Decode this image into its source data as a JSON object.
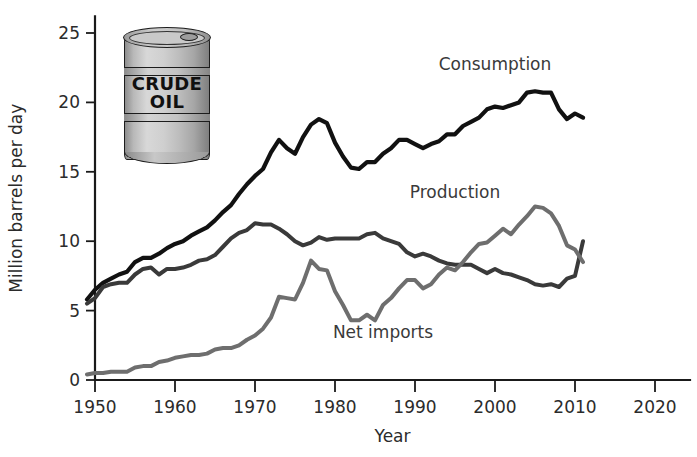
{
  "chart_data": {
    "type": "line",
    "title": "",
    "xlabel": "Year",
    "ylabel": "Million barrels per day",
    "xlim": [
      1948,
      2022
    ],
    "ylim": [
      0,
      26
    ],
    "xticks": [
      1950,
      1960,
      1970,
      1980,
      1990,
      2000,
      2010,
      2020
    ],
    "xtick_labels": [
      "1950",
      "1960",
      "1970",
      "1980",
      "1990",
      "2000",
      "2010",
      "2020"
    ],
    "yticks": [
      0,
      5,
      10,
      15,
      20,
      25
    ],
    "ytick_labels": [
      "0",
      "5",
      "10",
      "15",
      "20",
      "25"
    ],
    "grid": false,
    "legend_position": "inline-annotations",
    "x": [
      1949,
      1950,
      1951,
      1952,
      1953,
      1954,
      1955,
      1956,
      1957,
      1958,
      1959,
      1960,
      1961,
      1962,
      1963,
      1964,
      1965,
      1966,
      1967,
      1968,
      1969,
      1970,
      1971,
      1972,
      1973,
      1974,
      1975,
      1976,
      1977,
      1978,
      1979,
      1980,
      1981,
      1982,
      1983,
      1984,
      1985,
      1986,
      1987,
      1988,
      1989,
      1990,
      1991,
      1992,
      1993,
      1994,
      1995,
      1996,
      1997,
      1998,
      1999,
      2000,
      2001,
      2002,
      2003,
      2004,
      2005,
      2006,
      2007,
      2008,
      2009,
      2010,
      2011
    ],
    "series": [
      {
        "name": "Consumption",
        "color": "#111111",
        "width": 4.2,
        "label_x": 2000,
        "label_y": 22.3,
        "values": [
          5.8,
          6.5,
          7.0,
          7.3,
          7.6,
          7.8,
          8.5,
          8.8,
          8.8,
          9.1,
          9.5,
          9.8,
          10.0,
          10.4,
          10.7,
          11.0,
          11.5,
          12.1,
          12.6,
          13.4,
          14.1,
          14.7,
          15.2,
          16.4,
          17.3,
          16.7,
          16.3,
          17.5,
          18.4,
          18.8,
          18.5,
          17.1,
          16.1,
          15.3,
          15.2,
          15.7,
          15.7,
          16.3,
          16.7,
          17.3,
          17.3,
          17.0,
          16.7,
          17.0,
          17.2,
          17.7,
          17.7,
          18.3,
          18.6,
          18.9,
          19.5,
          19.7,
          19.6,
          19.8,
          20.0,
          20.7,
          20.8,
          20.7,
          20.7,
          19.5,
          18.8,
          19.2,
          18.9
        ]
      },
      {
        "name": "Production",
        "color": "#3a3a3a",
        "width": 4.0,
        "label_x": 1995,
        "label_y": 13.1,
        "values": [
          5.5,
          5.9,
          6.7,
          6.9,
          7.0,
          7.0,
          7.6,
          8.0,
          8.1,
          7.6,
          8.0,
          8.0,
          8.1,
          8.3,
          8.6,
          8.7,
          9.0,
          9.6,
          10.2,
          10.6,
          10.8,
          11.3,
          11.2,
          11.2,
          10.9,
          10.5,
          10.0,
          9.7,
          9.9,
          10.3,
          10.1,
          10.2,
          10.2,
          10.2,
          10.2,
          10.5,
          10.6,
          10.2,
          10.0,
          9.8,
          9.2,
          8.9,
          9.1,
          8.9,
          8.6,
          8.4,
          8.3,
          8.3,
          8.3,
          8.0,
          7.7,
          8.0,
          7.7,
          7.6,
          7.4,
          7.2,
          6.9,
          6.8,
          6.9,
          6.7,
          7.3,
          7.5,
          10.0
        ]
      },
      {
        "name": "Net imports",
        "color": "#6e6e6e",
        "width": 4.0,
        "label_x": 1986,
        "label_y": 3.0,
        "values": [
          0.4,
          0.5,
          0.5,
          0.6,
          0.6,
          0.6,
          0.9,
          1.0,
          1.0,
          1.3,
          1.4,
          1.6,
          1.7,
          1.8,
          1.8,
          1.9,
          2.2,
          2.3,
          2.3,
          2.5,
          2.9,
          3.2,
          3.7,
          4.5,
          6.0,
          5.9,
          5.8,
          7.0,
          8.6,
          8.0,
          7.9,
          6.4,
          5.4,
          4.3,
          4.3,
          4.7,
          4.3,
          5.4,
          5.9,
          6.6,
          7.2,
          7.2,
          6.6,
          6.9,
          7.6,
          8.1,
          7.9,
          8.5,
          9.2,
          9.8,
          9.9,
          10.4,
          10.9,
          10.5,
          11.2,
          11.8,
          12.5,
          12.4,
          12.0,
          11.1,
          9.7,
          9.4,
          8.5
        ]
      }
    ]
  },
  "illustration": {
    "name": "crude-oil-barrel",
    "line1": "CRUDE",
    "line2": "OIL"
  }
}
